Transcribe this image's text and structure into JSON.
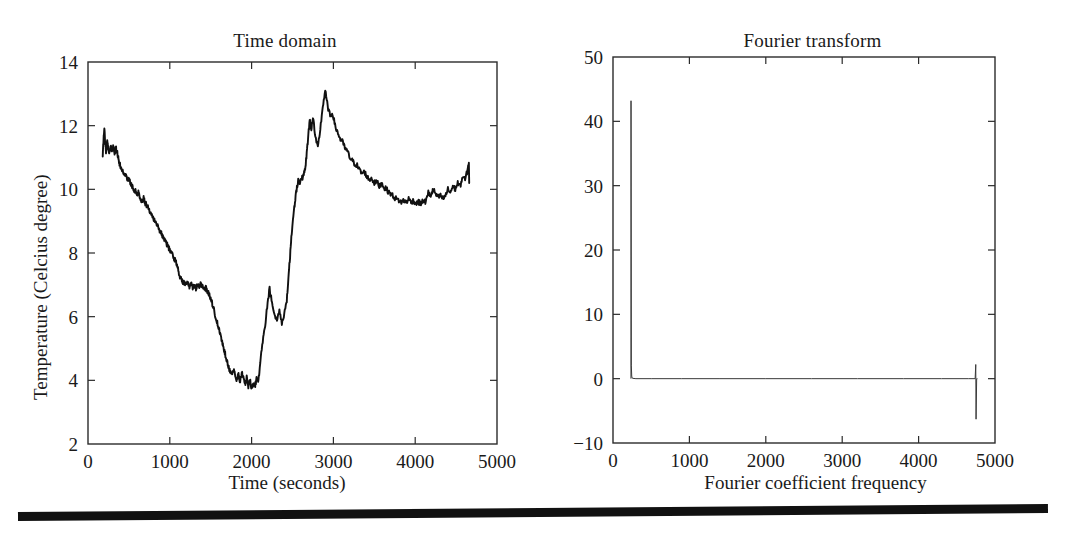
{
  "figure": {
    "bottom_rule": "horizontal-rule",
    "ink_color": "#111111"
  },
  "chart_data": [
    {
      "type": "line",
      "panel": "left",
      "title": "Time domain",
      "xlabel": "Time (seconds)",
      "ylabel": "Temperature (Celcius degree)",
      "xlim": [
        0,
        5000
      ],
      "ylim": [
        2,
        14
      ],
      "xticks": [
        0,
        1000,
        2000,
        3000,
        4000,
        5000
      ],
      "yticks": [
        2,
        4,
        6,
        8,
        10,
        12,
        14
      ],
      "xtick_labels": [
        "0",
        "1000",
        "2000",
        "3000",
        "4000",
        "5000"
      ],
      "ytick_labels": [
        "2",
        "4",
        "6",
        "8",
        "10",
        "12",
        "14"
      ],
      "grid": false,
      "legend": null,
      "series": [
        {
          "name": "Temperature",
          "x": [
            180,
            190,
            200,
            210,
            220,
            235,
            250,
            265,
            280,
            295,
            310,
            325,
            340,
            355,
            370,
            385,
            400,
            420,
            440,
            460,
            480,
            500,
            520,
            540,
            560,
            580,
            600,
            620,
            640,
            660,
            680,
            700,
            720,
            740,
            760,
            780,
            800,
            820,
            840,
            860,
            880,
            900,
            920,
            940,
            960,
            980,
            1000,
            1020,
            1040,
            1060,
            1080,
            1100,
            1120,
            1140,
            1160,
            1180,
            1200,
            1220,
            1240,
            1260,
            1280,
            1300,
            1320,
            1340,
            1360,
            1380,
            1400,
            1420,
            1440,
            1460,
            1480,
            1500,
            1520,
            1540,
            1560,
            1580,
            1600,
            1620,
            1640,
            1660,
            1680,
            1700,
            1720,
            1740,
            1760,
            1780,
            1800,
            1820,
            1840,
            1860,
            1880,
            1900,
            1920,
            1940,
            1960,
            1980,
            2000,
            2020,
            2040,
            2060,
            2080,
            2100,
            2130,
            2160,
            2190,
            2220,
            2250,
            2280,
            2310,
            2340,
            2370,
            2400,
            2430,
            2450,
            2470,
            2490,
            2510,
            2530,
            2550,
            2570,
            2590,
            2610,
            2630,
            2650,
            2670,
            2690,
            2710,
            2730,
            2750,
            2780,
            2810,
            2840,
            2870,
            2900,
            2930,
            2960,
            2990,
            3020,
            3050,
            3080,
            3110,
            3140,
            3170,
            3200,
            3230,
            3260,
            3290,
            3320,
            3350,
            3380,
            3410,
            3440,
            3470,
            3500,
            3530,
            3560,
            3590,
            3620,
            3650,
            3680,
            3710,
            3740,
            3770,
            3800,
            3830,
            3860,
            3890,
            3920,
            3950,
            3980,
            4010,
            4040,
            4070,
            4100,
            4130,
            4160,
            4190,
            4220,
            4250,
            4280,
            4310,
            4340,
            4370,
            4400,
            4430,
            4460,
            4490,
            4520,
            4550,
            4580,
            4610,
            4640,
            4660
          ],
          "y": [
            11.0,
            11.6,
            11.9,
            11.5,
            11.2,
            11.5,
            11.3,
            11.1,
            11.4,
            11.15,
            11.35,
            11.1,
            11.3,
            11.2,
            11.0,
            10.8,
            10.7,
            10.6,
            10.5,
            10.45,
            10.35,
            10.3,
            10.2,
            10.1,
            10.0,
            9.95,
            9.85,
            9.9,
            9.7,
            9.6,
            9.75,
            9.55,
            9.5,
            9.4,
            9.3,
            9.25,
            9.1,
            9.0,
            8.9,
            8.8,
            8.7,
            8.6,
            8.5,
            8.4,
            8.3,
            8.2,
            8.1,
            8.0,
            7.9,
            7.8,
            7.7,
            7.5,
            7.3,
            7.15,
            7.1,
            7.05,
            7.0,
            7.05,
            6.95,
            7.05,
            6.9,
            7.0,
            6.85,
            7.0,
            6.9,
            7.05,
            6.95,
            6.85,
            6.9,
            6.8,
            6.7,
            6.6,
            6.4,
            6.2,
            6.0,
            5.8,
            5.6,
            5.4,
            5.2,
            5.0,
            4.8,
            4.6,
            4.4,
            4.3,
            4.2,
            4.35,
            4.1,
            4.0,
            4.2,
            3.95,
            4.3,
            4.05,
            3.85,
            4.1,
            3.8,
            4.0,
            3.75,
            3.9,
            3.8,
            4.05,
            3.9,
            4.4,
            5.1,
            5.6,
            6.3,
            6.9,
            6.4,
            6.0,
            5.9,
            6.2,
            5.8,
            6.1,
            6.5,
            7.2,
            7.9,
            8.6,
            9.2,
            9.6,
            10.0,
            10.3,
            10.2,
            10.4,
            10.35,
            10.6,
            11.0,
            11.6,
            12.2,
            11.9,
            12.3,
            11.6,
            11.3,
            11.9,
            12.6,
            13.1,
            12.6,
            12.3,
            12.4,
            12.0,
            11.8,
            11.6,
            11.5,
            11.3,
            11.2,
            11.0,
            10.9,
            10.8,
            10.75,
            10.6,
            10.5,
            10.55,
            10.4,
            10.3,
            10.35,
            10.2,
            10.25,
            10.1,
            10.2,
            10.05,
            10.0,
            9.9,
            9.85,
            9.75,
            9.7,
            9.65,
            9.6,
            9.65,
            9.6,
            9.7,
            9.6,
            9.65,
            9.55,
            9.6,
            9.55,
            9.65,
            9.6,
            9.9,
            9.8,
            10.0,
            9.85,
            9.75,
            9.8,
            9.7,
            9.8,
            10.0,
            9.9,
            10.1,
            10.0,
            10.2,
            10.1,
            10.4,
            10.3,
            10.6,
            10.9,
            10.5,
            10.3,
            10.2,
            10.25,
            10.1,
            10.0,
            9.95,
            9.85,
            10.4,
            10.0,
            10.2
          ]
        }
      ]
    },
    {
      "type": "line",
      "panel": "right",
      "title": "Fourier transform",
      "xlabel": "Fourier coefficient frequency",
      "ylabel": "Fourier coefficient amplitude/1000",
      "xlim": [
        0,
        5000
      ],
      "ylim": [
        -10,
        50
      ],
      "xticks": [
        0,
        1000,
        2000,
        3000,
        4000,
        5000
      ],
      "yticks": [
        -10,
        0,
        10,
        20,
        30,
        40,
        50
      ],
      "xtick_labels": [
        "0",
        "1000",
        "2000",
        "3000",
        "4000",
        "5000"
      ],
      "ytick_labels": [
        "−10",
        "0",
        "10",
        "20",
        "30",
        "40",
        "50"
      ],
      "grid": false,
      "legend": null,
      "series": [
        {
          "name": "Fourier coefficient amplitude",
          "x": [
            235,
            236,
            240,
            245,
            250,
            260,
            300,
            500,
            900,
            1400,
            2000,
            2600,
            3200,
            3800,
            4300,
            4650,
            4740,
            4748,
            4752,
            4760,
            4770
          ],
          "y": [
            0.0,
            43.2,
            2.0,
            0.4,
            0.1,
            0.05,
            0.0,
            0.0,
            0.0,
            0.0,
            0.0,
            0.0,
            0.0,
            0.0,
            0.0,
            0.0,
            0.0,
            2.2,
            -6.3,
            0.0,
            0.0
          ]
        }
      ]
    }
  ]
}
